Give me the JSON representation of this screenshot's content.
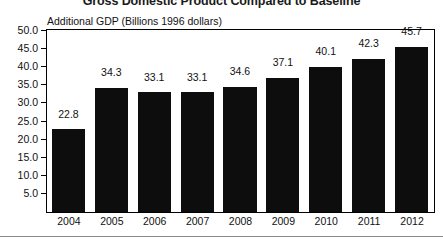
{
  "chart_data": {
    "type": "bar",
    "title": "Gross Domestic Product Compared to Baseline",
    "subtitle": "Additional GDP (Billions 1996 dollars)",
    "xlabel": "",
    "ylabel": "Additional GDP (Billions 1996 dollars)",
    "categories": [
      "2004",
      "2005",
      "2006",
      "2007",
      "2008",
      "2009",
      "2010",
      "2011",
      "2012"
    ],
    "values": [
      22.8,
      34.3,
      33.1,
      33.1,
      34.6,
      37.1,
      40.1,
      42.3,
      45.7
    ],
    "value_labels": [
      "22.8",
      "34.3",
      "33.1",
      "33.1",
      "34.6",
      "37.1",
      "40.1",
      "42.3",
      "45.7"
    ],
    "ylim": [
      0,
      50
    ],
    "ytick_values": [
      50.0,
      45.0,
      40.0,
      35.0,
      30.0,
      25.0,
      20.0,
      15.0,
      10.0,
      5.0
    ],
    "ytick_labels": [
      "50.0",
      "45.0",
      "40.0",
      "35.0",
      "30.0",
      "25.0",
      "20.0",
      "15.0",
      "10.0",
      "5.0"
    ],
    "grid": false,
    "legend": null,
    "bar_color": "#0d0d0d",
    "background_color": "#ffffff",
    "axis_color": "#000000"
  }
}
